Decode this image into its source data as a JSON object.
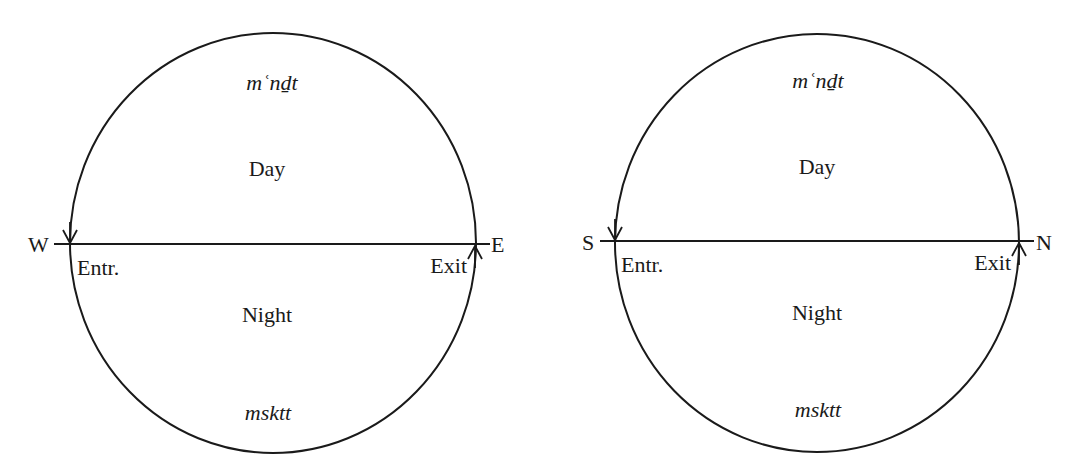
{
  "diagrams": [
    {
      "id": "left",
      "transliteration_top": "mʿnḏt",
      "upper_label": "Day",
      "lower_label": "Night",
      "transliteration_bottom": "msktt",
      "left_direction": "W",
      "right_direction": "E",
      "entry_label": "Entr.",
      "exit_label": "Exit"
    },
    {
      "id": "right",
      "transliteration_top": "mʿnḏt",
      "upper_label": "Day",
      "lower_label": "Night",
      "transliteration_bottom": "msktt",
      "left_direction": "S",
      "right_direction": "N",
      "entry_label": "Entr.",
      "exit_label": "Exit"
    }
  ],
  "colors": {
    "stroke": "#1a1a1a",
    "background": "#ffffff"
  }
}
